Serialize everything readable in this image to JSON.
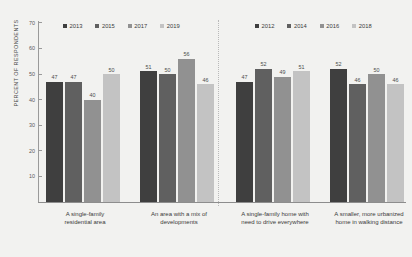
{
  "chart_data": {
    "type": "bar",
    "title": "",
    "xlabel": "",
    "ylabel": "PERCENT OF RESPONDENTS",
    "ylim": [
      0,
      70
    ],
    "yticks": [
      10,
      20,
      30,
      40,
      50,
      60,
      70
    ],
    "grid": false,
    "legend_position": "top",
    "categories": [
      "A single-family residential area",
      "An area with a mix of developments",
      "A single-family home with need to drive everywhere",
      "A smaller, more urbanized home in walking distance"
    ],
    "series": [
      {
        "name": "2013",
        "color": "#3f3f3f",
        "values": [
          47,
          51,
          null,
          null
        ]
      },
      {
        "name": "2015",
        "color": "#606060",
        "values": [
          47,
          50,
          null,
          null
        ]
      },
      {
        "name": "2017",
        "color": "#919191",
        "values": [
          40,
          56,
          null,
          null
        ]
      },
      {
        "name": "2019",
        "color": "#c3c3c3",
        "values": [
          50,
          46,
          null,
          null
        ]
      },
      {
        "name": "2012",
        "color": "#3f3f3f",
        "values": [
          null,
          null,
          47,
          52
        ]
      },
      {
        "name": "2014",
        "color": "#606060",
        "values": [
          null,
          null,
          52,
          46
        ]
      },
      {
        "name": "2016",
        "color": "#919191",
        "values": [
          null,
          null,
          49,
          50
        ]
      },
      {
        "name": "2018",
        "color": "#c3c3c3",
        "values": [
          null,
          null,
          51,
          46
        ]
      }
    ],
    "groups": [
      {
        "category_line1": "A single-family",
        "category_line2": "residential area",
        "bars": [
          {
            "label": "2013",
            "value": 47,
            "color": "#3f3f3f"
          },
          {
            "label": "2015",
            "value": 47,
            "color": "#606060"
          },
          {
            "label": "2017",
            "value": 40,
            "color": "#919191"
          },
          {
            "label": "2019",
            "value": 50,
            "color": "#c3c3c3"
          }
        ]
      },
      {
        "category_line1": "An area with a mix of",
        "category_line2": "developments",
        "bars": [
          {
            "label": "2013",
            "value": 51,
            "color": "#3f3f3f"
          },
          {
            "label": "2015",
            "value": 50,
            "color": "#606060"
          },
          {
            "label": "2017",
            "value": 56,
            "color": "#919191"
          },
          {
            "label": "2019",
            "value": 46,
            "color": "#c3c3c3"
          }
        ]
      },
      {
        "category_line1": "A single-family home with",
        "category_line2": "need to drive everywhere",
        "bars": [
          {
            "label": "2012",
            "value": 47,
            "color": "#3f3f3f"
          },
          {
            "label": "2014",
            "value": 52,
            "color": "#606060"
          },
          {
            "label": "2016",
            "value": 49,
            "color": "#919191"
          },
          {
            "label": "2018",
            "value": 51,
            "color": "#c3c3c3"
          }
        ]
      },
      {
        "category_line1": "A smaller, more urbanized",
        "category_line2": "home in walking distance",
        "bars": [
          {
            "label": "2012",
            "value": 52,
            "color": "#3f3f3f"
          },
          {
            "label": "2014",
            "value": 46,
            "color": "#606060"
          },
          {
            "label": "2016",
            "value": 50,
            "color": "#919191"
          },
          {
            "label": "2018",
            "value": 46,
            "color": "#c3c3c3"
          }
        ]
      }
    ],
    "legends": [
      {
        "id": "left",
        "items": [
          {
            "label": "2013",
            "color": "#3f3f3f"
          },
          {
            "label": "2015",
            "color": "#606060"
          },
          {
            "label": "2017",
            "color": "#919191"
          },
          {
            "label": "2019",
            "color": "#c3c3c3"
          }
        ]
      },
      {
        "id": "right",
        "items": [
          {
            "label": "2012",
            "color": "#3f3f3f"
          },
          {
            "label": "2014",
            "color": "#606060"
          },
          {
            "label": "2016",
            "color": "#919191"
          },
          {
            "label": "2018",
            "color": "#c3c3c3"
          }
        ]
      }
    ]
  },
  "layout": {
    "group_left_positions": [
      46,
      140,
      236,
      330
    ],
    "plot_baseline_y": 202,
    "px_per_unit": 2.56
  }
}
